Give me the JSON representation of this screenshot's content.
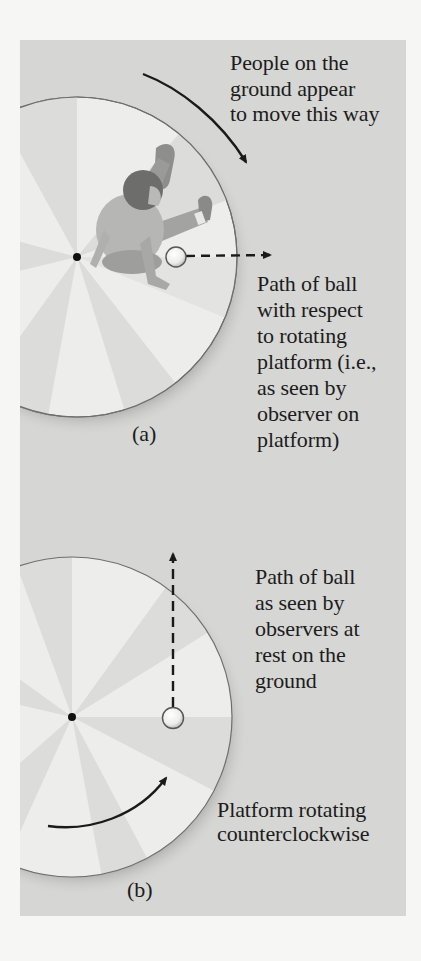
{
  "figure": {
    "panel_a": {
      "label": "(a)",
      "caption_motion": "People on the\nground appear\nto move this way",
      "caption_path": "Path of ball\nwith respect\nto rotating\nplatform (i.e.,\nas seen by\nobserver on\nplatform)",
      "elements": [
        "rotating-platform",
        "child-figure",
        "ball",
        "dashed-path-arrow-right",
        "curved-arrow-clockwise"
      ]
    },
    "panel_b": {
      "label": "(b)",
      "caption_path": "Path of ball\nas seen by\nobservers at\nrest on the\nground",
      "caption_rotation": "Platform rotating\ncounterclockwise",
      "elements": [
        "rotating-platform",
        "ball",
        "dashed-path-arrow-up",
        "curved-arrow-counterclockwise"
      ]
    },
    "colors": {
      "page": "#f6f6f4",
      "panel": "#d6d6d4",
      "sector_light": "#ededeb",
      "sector_dark": "#dcdcda",
      "ink": "#1c1c1c"
    }
  }
}
